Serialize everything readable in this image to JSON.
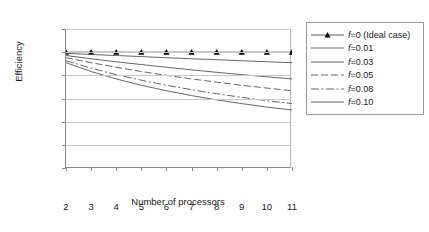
{
  "chart_data": {
    "type": "line",
    "title": "",
    "xlabel": "Number of processors",
    "ylabel": "Efficiency",
    "x": [
      2,
      3,
      4,
      5,
      6,
      7,
      8,
      9,
      10,
      11
    ],
    "xlim": [
      2,
      11
    ],
    "ylim": [
      0.0,
      1.2
    ],
    "xticks": [
      "2",
      "3",
      "4",
      "5",
      "6",
      "7",
      "8",
      "9",
      "10",
      "11"
    ],
    "yticks": [
      "0.00",
      "0.20",
      "0.40",
      "0.60",
      "0.80",
      "1.00",
      "1.20"
    ],
    "grid": "horizontal",
    "legend_position": "right",
    "series": [
      {
        "name": "f=0 (Ideal case)",
        "f": 0,
        "style": "solid-marker",
        "marker": "triangle",
        "color": "#4d4d4d",
        "values": [
          1.0,
          1.0,
          1.0,
          1.0,
          1.0,
          1.0,
          1.0,
          1.0,
          1.0,
          1.0
        ]
      },
      {
        "name": "f=0.01",
        "f": 0.01,
        "style": "solid",
        "color": "#555555",
        "values": [
          0.99,
          0.98,
          0.971,
          0.962,
          0.952,
          0.943,
          0.935,
          0.926,
          0.917,
          0.909
        ]
      },
      {
        "name": "f=0.03",
        "f": 0.03,
        "style": "solid",
        "color": "#555555",
        "values": [
          0.971,
          0.943,
          0.917,
          0.893,
          0.87,
          0.847,
          0.826,
          0.806,
          0.787,
          0.769
        ]
      },
      {
        "name": "f=0.05",
        "f": 0.05,
        "style": "dashed",
        "color": "#555555",
        "values": [
          0.952,
          0.909,
          0.87,
          0.833,
          0.8,
          0.769,
          0.741,
          0.714,
          0.69,
          0.667
        ]
      },
      {
        "name": "f=0.08",
        "f": 0.08,
        "style": "dashdot",
        "color": "#555555",
        "values": [
          0.926,
          0.862,
          0.806,
          0.758,
          0.714,
          0.676,
          0.641,
          0.61,
          0.581,
          0.556
        ]
      },
      {
        "name": "f=0.10",
        "f": 0.1,
        "style": "solid",
        "color": "#555555",
        "values": [
          0.909,
          0.833,
          0.769,
          0.714,
          0.667,
          0.625,
          0.588,
          0.556,
          0.526,
          0.5
        ]
      }
    ]
  },
  "legend": {
    "items": [
      {
        "label": "f=0 (Ideal case)"
      },
      {
        "label": "f=0.01"
      },
      {
        "label": "f=0.03"
      },
      {
        "label": "f=0.05"
      },
      {
        "label": "f=0.08"
      },
      {
        "label": "f=0.10"
      }
    ]
  }
}
